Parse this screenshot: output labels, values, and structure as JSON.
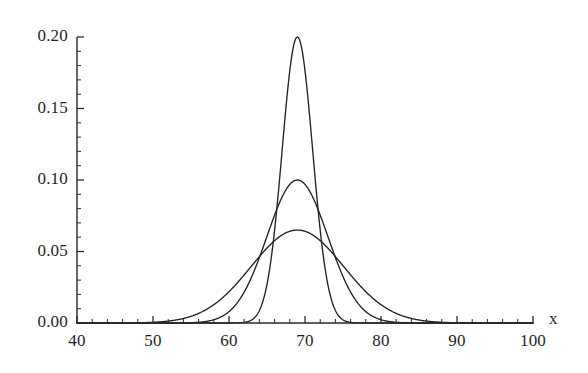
{
  "chart_data": {
    "type": "line",
    "title": "",
    "subtitle": "",
    "xlabel": "x",
    "ylabel": "",
    "xlim": [
      40,
      100
    ],
    "ylim": [
      0.0,
      0.2
    ],
    "grid": false,
    "legend": "none",
    "background_color": "#ffffff",
    "line_color": "#222222",
    "x_ticks": [
      40,
      50,
      60,
      70,
      80,
      90,
      100
    ],
    "x_tick_labels": [
      "40",
      "50",
      "60",
      "70",
      "80",
      "90",
      "100"
    ],
    "x_minor_step": 2,
    "y_ticks": [
      0.0,
      0.05,
      0.1,
      0.15,
      0.2
    ],
    "y_tick_labels": [
      "0.00",
      "0.05",
      "0.10",
      "0.15",
      "0.20"
    ],
    "y_minor_step": 0.01,
    "annotations": [],
    "series": [
      {
        "name": "narrow-normal",
        "distribution": "normal",
        "mean": 69,
        "sigma": 2.0,
        "peak_value": 0.2,
        "peak_x": 69
      },
      {
        "name": "medium-normal",
        "distribution": "normal",
        "mean": 69,
        "sigma": 4.0,
        "peak_value": 0.1,
        "peak_x": 69
      },
      {
        "name": "wide-normal",
        "distribution": "normal",
        "mean": 69,
        "sigma": 6.1,
        "peak_value": 0.065,
        "peak_x": 69
      }
    ]
  },
  "axes": {
    "x_axis_name": "x",
    "y_axis_name": ""
  }
}
